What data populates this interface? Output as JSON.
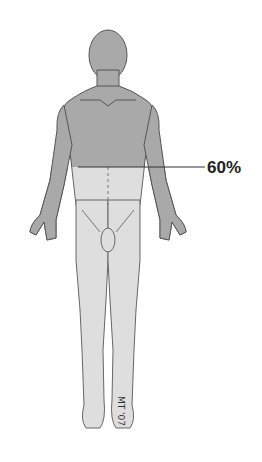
{
  "diagram": {
    "title": "",
    "regions": [
      {
        "name": "upper-body",
        "shade": "#a9a9a9"
      },
      {
        "name": "lower-body",
        "shade": "#dedede"
      }
    ],
    "marker_label": "60%",
    "signature": "MT '07"
  }
}
